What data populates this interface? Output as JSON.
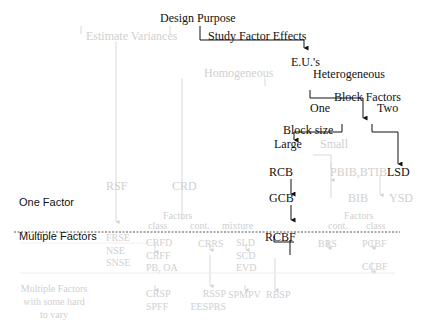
{
  "diagram": {
    "root": "Design Purpose",
    "purpose_options": {
      "estimate_variances": "Estimate Variances",
      "study_factor_effects": "Study Factor Effects"
    },
    "eu": "E.U.'s",
    "eu_options": {
      "homogeneous": "Homogeneous",
      "heterogeneous": "Heterogeneous"
    },
    "block_factors": "Block Factors",
    "block_options": {
      "one": "One",
      "two": "Two"
    },
    "block_size": "Block size",
    "block_size_options": {
      "large": "Large",
      "small": "Small"
    },
    "row_labels": {
      "one_factor": "One Factor",
      "multiple_factors": "Multiple Factors",
      "hard_to_vary_1": "Multiple Factors",
      "hard_to_vary_2": "with some hard",
      "hard_to_vary_3": "to vary"
    },
    "one_factor_designs": {
      "rsf": "RSF",
      "crd": "CRD",
      "rcb": "RCB",
      "gcb": "GCB",
      "pbib_btib": "PBIB,BTIB",
      "bib": "BIB",
      "lsd": "LSD",
      "ysd": "YSD"
    },
    "crd_factors": {
      "label": "Factors",
      "class": "class",
      "cont": "cont.",
      "mixture": "mixture"
    },
    "block_factors_types": {
      "label": "Factors",
      "cont": "cont.",
      "class": "class"
    },
    "multiple_factor_designs": {
      "rsf_col": [
        "FRSE",
        "NSE",
        "SNSE"
      ],
      "class_col": [
        "CRFD",
        "CRFF",
        "PB, OA"
      ],
      "cont_col": [
        "CRRS"
      ],
      "mixture_col": [
        "SLD",
        "SCD",
        "EVD"
      ],
      "rcbf": "RCBF",
      "brs": "BRS",
      "pcbf": "PCBF",
      "ccbf": "CCBF"
    },
    "hard_to_vary_designs": {
      "class_col": [
        "CRSP",
        "SPFF"
      ],
      "cont_col": [
        "RSSP",
        "EESPRS"
      ],
      "mixture_col": [
        "SPMPV"
      ],
      "rcbf_col": [
        "RBSP"
      ]
    },
    "colors": {
      "active": "#111111",
      "inactive": "#d0d0d0",
      "divider": "#555555"
    }
  }
}
